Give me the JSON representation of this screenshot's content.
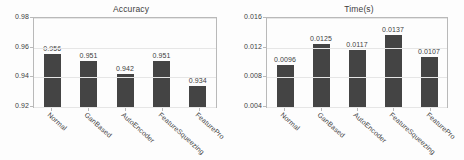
{
  "figure": {
    "width": 464,
    "height": 160,
    "background": "#fdfdfd",
    "bar_color": "#444444",
    "grid_color": "#e6e6e6",
    "axis_color": "#b9b9b9",
    "text_color": "#3d3d3d"
  },
  "chart_data": [
    {
      "type": "bar",
      "title": "Accuracy",
      "xlabel": "",
      "ylabel": "",
      "categories": [
        "Normal",
        "GanBased",
        "AutoEncoder",
        "FeatureSqueezing",
        "FeaturePro"
      ],
      "values": [
        0.956,
        0.951,
        0.942,
        0.951,
        0.934
      ],
      "value_labels": [
        "0.956",
        "0.951",
        "0.942",
        "0.951",
        "0.934"
      ],
      "ylim": [
        0.92,
        0.98
      ],
      "yticks": [
        0.92,
        0.94,
        0.96,
        0.98
      ],
      "ytick_labels": [
        "0.92",
        "0.94",
        "0.96",
        "0.98"
      ],
      "grid": true,
      "legend": "none"
    },
    {
      "type": "bar",
      "title": "Time(s)",
      "xlabel": "",
      "ylabel": "",
      "categories": [
        "Normal",
        "GanBased",
        "AutoEncoder",
        "FeatureSqueezing",
        "FeaturePro"
      ],
      "values": [
        0.0096,
        0.0125,
        0.0117,
        0.0137,
        0.0107
      ],
      "value_labels": [
        "0.0096",
        "0.0125",
        "0.0117",
        "0.0137",
        "0.0107"
      ],
      "ylim": [
        0.004,
        0.016
      ],
      "yticks": [
        0.004,
        0.008,
        0.012,
        0.016
      ],
      "ytick_labels": [
        "0.004",
        "0.008",
        "0.012",
        "0.016"
      ],
      "grid": true,
      "legend": "none"
    }
  ]
}
